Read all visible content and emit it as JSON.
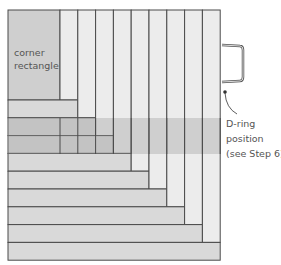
{
  "diagram": {
    "type": "log-cabin quilt block layout",
    "corner_label": [
      "corner",
      "rectangle"
    ],
    "annotation": [
      "D-ring",
      "position",
      "(see Step 6)"
    ],
    "colors": {
      "corner": "#cfcfcf",
      "vertical_strip": "#ececec",
      "horizontal_strip": "#d9d9d9",
      "band_overlay": "#9a9a9a",
      "outline": "#4a4a4a",
      "d_ring": "#555555"
    },
    "grid": {
      "left": 8,
      "top": 10,
      "corner_right": 60,
      "corner_bottom": 100,
      "step": 17.8,
      "strips": 9
    },
    "band": {
      "top": 118,
      "bottom": 154
    }
  }
}
